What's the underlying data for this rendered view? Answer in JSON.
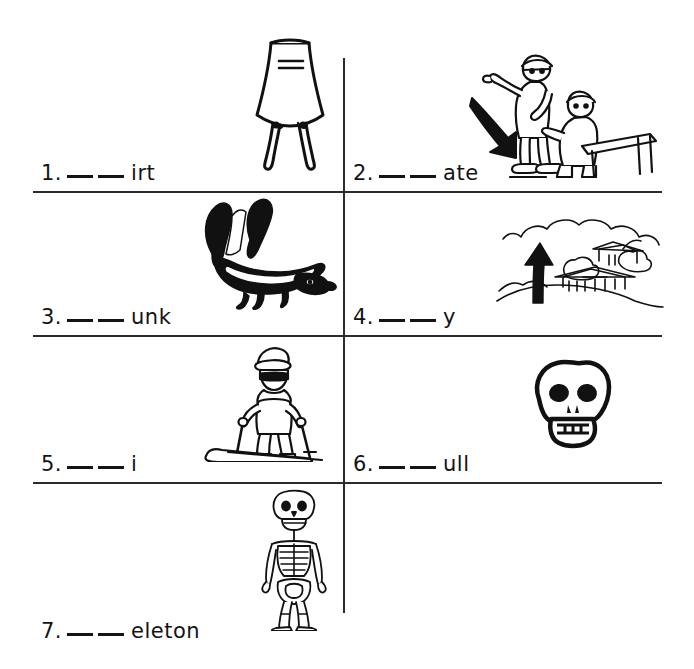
{
  "worksheet": {
    "title": "sk blend picture worksheet",
    "background_color": "#ffffff",
    "ink_color": "#1a1a1a",
    "rule_color": "#2b2b2b"
  },
  "items": [
    {
      "number": "1.",
      "blank1": "",
      "blank2": "",
      "ending": "irt",
      "picture": "skirt-picture",
      "picture_label": "skirt"
    },
    {
      "number": "2.",
      "blank1": "",
      "blank2": "",
      "ending": "ate",
      "picture": "skating-picture",
      "picture_label": "skating"
    },
    {
      "number": "3.",
      "blank1": "",
      "blank2": "",
      "ending": "unk",
      "picture": "skunk-picture",
      "picture_label": "skunk"
    },
    {
      "number": "4.",
      "blank1": "",
      "blank2": "",
      "ending": "y",
      "picture": "sky-picture",
      "picture_label": "sky"
    },
    {
      "number": "5.",
      "blank1": "",
      "blank2": "",
      "ending": "i",
      "picture": "ski-picture",
      "picture_label": "skier"
    },
    {
      "number": "6.",
      "blank1": "",
      "blank2": "",
      "ending": "ull",
      "picture": "skull-picture",
      "picture_label": "skull"
    },
    {
      "number": "7.",
      "blank1": "",
      "blank2": "",
      "ending": "eleton",
      "picture": "skeleton-picture",
      "picture_label": "skeleton"
    }
  ]
}
